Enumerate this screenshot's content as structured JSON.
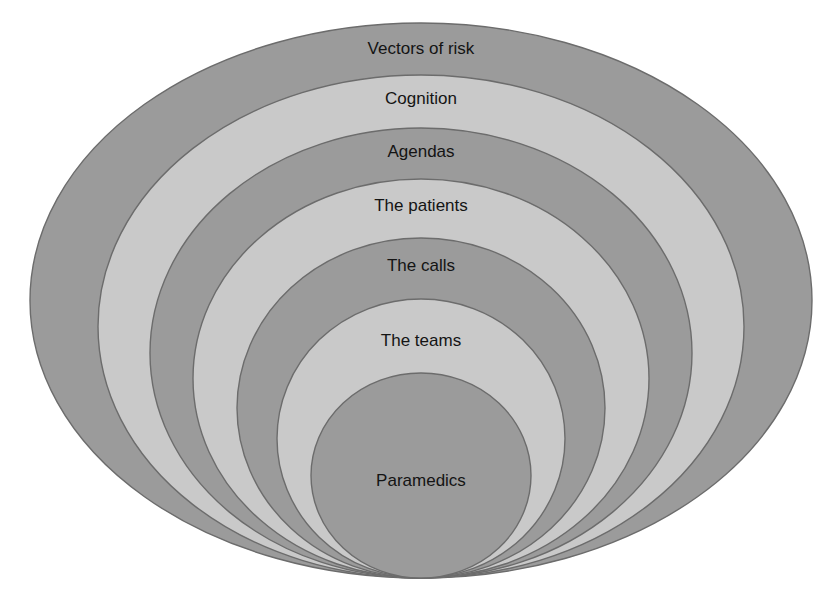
{
  "diagram": {
    "type": "nested-ellipses",
    "colors": {
      "dark": "#9b9b9b",
      "light": "#c9c9c9",
      "stroke": "#6c6c6c",
      "text": "#141414",
      "background": "#ffffff"
    },
    "layers": [
      {
        "label": "Vectors of risk",
        "shade": "dark",
        "cx": 421,
        "cy": 300.5,
        "rx": 391,
        "ry": 277.5,
        "label_y": 54
      },
      {
        "label": "Cognition",
        "shade": "light",
        "cx": 421,
        "cy": 326.5,
        "rx": 323,
        "ry": 251.5,
        "label_y": 104
      },
      {
        "label": "Agendas",
        "shade": "dark",
        "cx": 421,
        "cy": 353,
        "rx": 271,
        "ry": 225,
        "label_y": 157
      },
      {
        "label": "The patients",
        "shade": "light",
        "cx": 421,
        "cy": 378.5,
        "rx": 228,
        "ry": 199.5,
        "label_y": 211
      },
      {
        "label": "The calls",
        "shade": "dark",
        "cx": 421,
        "cy": 408,
        "rx": 184,
        "ry": 170,
        "label_y": 271
      },
      {
        "label": "The teams",
        "shade": "light",
        "cx": 421,
        "cy": 438.5,
        "rx": 144,
        "ry": 139.5,
        "label_y": 346
      },
      {
        "label": "Paramedics",
        "shade": "dark",
        "cx": 421,
        "cy": 475.5,
        "rx": 110,
        "ry": 102.5,
        "label_y": 486
      }
    ]
  }
}
